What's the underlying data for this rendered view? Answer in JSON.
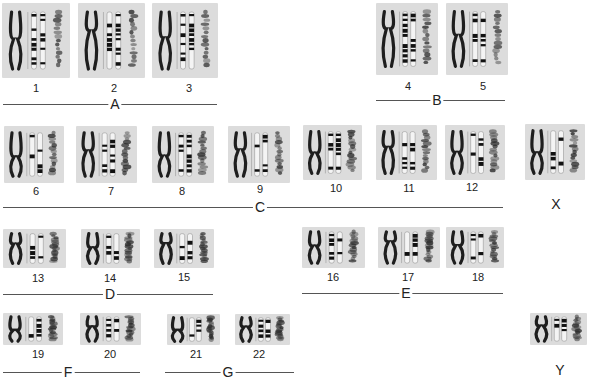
{
  "figure": {
    "chromosomes": [
      {
        "id": "1",
        "label": "1",
        "group": "A",
        "x": 2,
        "y": 3,
        "w": 68,
        "h": 75,
        "lx": 36,
        "ly": 82
      },
      {
        "id": "2",
        "label": "2",
        "group": "A",
        "x": 78,
        "y": 3,
        "w": 67,
        "h": 75,
        "lx": 114,
        "ly": 82
      },
      {
        "id": "3",
        "label": "3",
        "group": "A",
        "x": 152,
        "y": 3,
        "w": 66,
        "h": 75,
        "lx": 189,
        "ly": 82
      },
      {
        "id": "4",
        "label": "4",
        "group": "B",
        "x": 376,
        "y": 3,
        "w": 62,
        "h": 72,
        "lx": 408,
        "ly": 80
      },
      {
        "id": "5",
        "label": "5",
        "group": "B",
        "x": 446,
        "y": 3,
        "w": 62,
        "h": 72,
        "lx": 483,
        "ly": 80
      },
      {
        "id": "6",
        "label": "6",
        "group": "C",
        "x": 4,
        "y": 126,
        "w": 60,
        "h": 57,
        "lx": 36,
        "ly": 185
      },
      {
        "id": "7",
        "label": "7",
        "group": "C",
        "x": 76,
        "y": 126,
        "w": 61,
        "h": 57,
        "lx": 111,
        "ly": 185
      },
      {
        "id": "8",
        "label": "8",
        "group": "C",
        "x": 152,
        "y": 126,
        "w": 62,
        "h": 57,
        "lx": 182,
        "ly": 185
      },
      {
        "id": "9",
        "label": "9",
        "group": "C",
        "x": 228,
        "y": 126,
        "w": 62,
        "h": 57,
        "lx": 260,
        "ly": 183
      },
      {
        "id": "10",
        "label": "10",
        "group": "C",
        "x": 303,
        "y": 125,
        "w": 59,
        "h": 55,
        "lx": 336,
        "ly": 182
      },
      {
        "id": "11",
        "label": "11",
        "group": "C",
        "x": 376,
        "y": 125,
        "w": 61,
        "h": 55,
        "lx": 409,
        "ly": 182
      },
      {
        "id": "12",
        "label": "12",
        "group": "C",
        "x": 445,
        "y": 125,
        "w": 60,
        "h": 55,
        "lx": 472,
        "ly": 181
      },
      {
        "id": "13",
        "label": "13",
        "group": "D",
        "x": 3,
        "y": 229,
        "w": 63,
        "h": 39,
        "lx": 38,
        "ly": 272
      },
      {
        "id": "14",
        "label": "14",
        "group": "D",
        "x": 81,
        "y": 229,
        "w": 59,
        "h": 39,
        "lx": 110,
        "ly": 272
      },
      {
        "id": "15",
        "label": "15",
        "group": "D",
        "x": 154,
        "y": 229,
        "w": 60,
        "h": 39,
        "lx": 184,
        "ly": 271
      },
      {
        "id": "16",
        "label": "16",
        "group": "E",
        "x": 302,
        "y": 227,
        "w": 63,
        "h": 41,
        "lx": 333,
        "ly": 271
      },
      {
        "id": "17",
        "label": "17",
        "group": "E",
        "x": 378,
        "y": 227,
        "w": 62,
        "h": 41,
        "lx": 408,
        "ly": 271
      },
      {
        "id": "18",
        "label": "18",
        "group": "E",
        "x": 446,
        "y": 227,
        "w": 58,
        "h": 41,
        "lx": 478,
        "ly": 271
      },
      {
        "id": "19",
        "label": "19",
        "group": "F",
        "x": 3,
        "y": 313,
        "w": 60,
        "h": 32,
        "lx": 38,
        "ly": 348
      },
      {
        "id": "20",
        "label": "20",
        "group": "F",
        "x": 80,
        "y": 313,
        "w": 61,
        "h": 32,
        "lx": 110,
        "ly": 348
      },
      {
        "id": "21",
        "label": "21",
        "group": "G",
        "x": 167,
        "y": 314,
        "w": 53,
        "h": 31,
        "lx": 196,
        "ly": 348
      },
      {
        "id": "22",
        "label": "22",
        "group": "G",
        "x": 235,
        "y": 314,
        "w": 55,
        "h": 31,
        "lx": 259,
        "ly": 348
      },
      {
        "id": "X",
        "label": "",
        "group": "X",
        "x": 525,
        "y": 124,
        "w": 60,
        "h": 56,
        "lx": 0,
        "ly": 0
      },
      {
        "id": "Y",
        "label": "",
        "group": "Y",
        "x": 530,
        "y": 313,
        "w": 57,
        "h": 32,
        "lx": 0,
        "ly": 0
      }
    ],
    "groups": [
      {
        "label": "A",
        "x1": 3,
        "x2": 217,
        "y": 104,
        "lx": 115
      },
      {
        "label": "B",
        "x1": 376,
        "x2": 505,
        "y": 100,
        "lx": 437
      },
      {
        "label": "C",
        "x1": 3,
        "x2": 503,
        "y": 207,
        "lx": 260
      },
      {
        "label": "D",
        "x1": 3,
        "x2": 213,
        "y": 294,
        "lx": 110
      },
      {
        "label": "E",
        "x1": 302,
        "x2": 503,
        "y": 293,
        "lx": 406
      },
      {
        "label": "F",
        "x1": 3,
        "x2": 140,
        "y": 372,
        "lx": 68
      },
      {
        "label": "G",
        "x1": 165,
        "x2": 294,
        "y": 372,
        "lx": 228
      }
    ],
    "sex_chromosomes": [
      {
        "label": "X",
        "x": 556,
        "y": 196
      },
      {
        "label": "Y",
        "x": 560,
        "y": 362
      }
    ]
  }
}
